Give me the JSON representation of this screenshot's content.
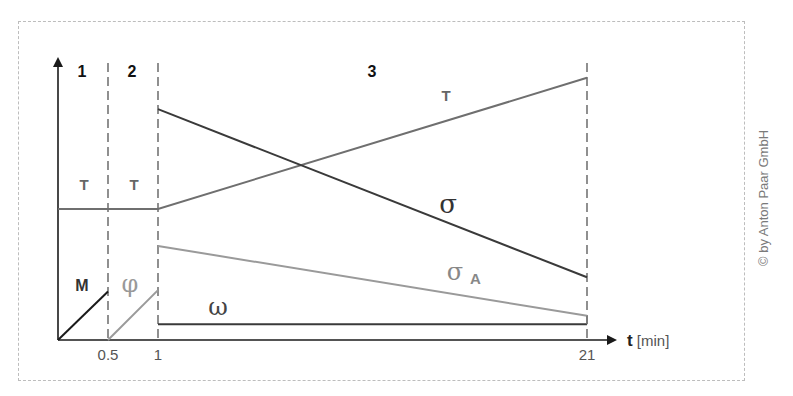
{
  "copyright": "© by Anton Paar GmbH",
  "colors": {
    "dark": "#3a3a3a",
    "mid": "#6f6f6f",
    "light": "#9a9a9a",
    "axis": "#1a1a1a"
  },
  "chart_data": {
    "type": "line",
    "title": "",
    "xlabel_bold": "t",
    "xlabel_unit": "[min]",
    "ylabel": "",
    "x_ticks": [
      "0.5",
      "1",
      "21"
    ],
    "phases": [
      {
        "label": "1",
        "start": 0,
        "end": 0.5
      },
      {
        "label": "2",
        "start": 0.5,
        "end": 1
      },
      {
        "label": "3",
        "start": 1,
        "end": 21
      }
    ],
    "boundaries": [
      0.5,
      1,
      21
    ],
    "series": [
      {
        "name": "T",
        "labels": [
          "T",
          "T",
          "T"
        ],
        "color": "mid",
        "points": [
          [
            0,
            0.46
          ],
          [
            1,
            0.46
          ],
          [
            21,
            0.92
          ]
        ]
      },
      {
        "name": "σ",
        "label": "σ",
        "color": "dark",
        "points": [
          [
            1,
            0.81
          ],
          [
            21,
            0.22
          ]
        ]
      },
      {
        "name": "σA",
        "label": "σ",
        "sub": "A",
        "color": "light",
        "points": [
          [
            1,
            0.33
          ],
          [
            21,
            0.085
          ]
        ]
      },
      {
        "name": "ω",
        "label": "ω",
        "color": "dark",
        "points": [
          [
            1,
            0.055
          ],
          [
            21,
            0.055
          ]
        ]
      },
      {
        "name": "M",
        "label": "M",
        "color": "axis",
        "points": [
          [
            0,
            0
          ],
          [
            0.5,
            0.17
          ]
        ]
      },
      {
        "name": "φ",
        "label": "φ",
        "color": "light",
        "points": [
          [
            0.5,
            0
          ],
          [
            1,
            0.175
          ]
        ]
      }
    ],
    "y_units": "relative (no scale shown)"
  }
}
